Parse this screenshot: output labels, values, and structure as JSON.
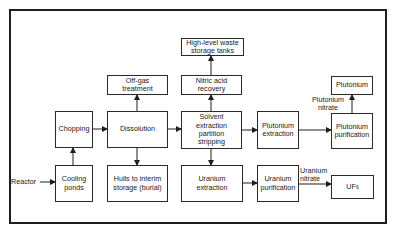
{
  "diagram": {
    "nodes": {
      "reactor": {
        "label": "Reactor"
      },
      "cooling_ponds": {
        "label": "Cooling\nponds"
      },
      "chopping": {
        "label": "Chopping"
      },
      "dissolution": {
        "label": "Dissolution"
      },
      "off_gas": {
        "label": "Off-gas\ntreatment"
      },
      "hulls": {
        "label": "Hulls to interim\nstorage (burial)"
      },
      "solvent": {
        "label": "Solvent\nextraction\npartition\nstripping"
      },
      "nitric_acid": {
        "label": "Nitric acid\nrecovery"
      },
      "hlw_tanks": {
        "label": "High-level waste\nstorage tanks"
      },
      "pu_extraction": {
        "label": "Plutonium\nextraction"
      },
      "pu_purification": {
        "label": "Plutonium\npurification"
      },
      "plutonium": {
        "label": "Plutonium"
      },
      "u_extraction": {
        "label": "Uranium\nextraction"
      },
      "u_purification": {
        "label": "Uranium\npurification"
      },
      "uf6": {
        "label": "UF",
        "subscript": "6"
      }
    },
    "edge_labels": {
      "plutonium_nitrate": "Plutonium\nnitrate",
      "uranium_nitrate": "Uranium\nnitrate"
    },
    "edges": [
      [
        "reactor",
        "cooling_ponds"
      ],
      [
        "cooling_ponds",
        "chopping"
      ],
      [
        "chopping",
        "dissolution"
      ],
      [
        "dissolution",
        "off_gas"
      ],
      [
        "dissolution",
        "hulls"
      ],
      [
        "dissolution",
        "solvent"
      ],
      [
        "solvent",
        "nitric_acid"
      ],
      [
        "nitric_acid",
        "hlw_tanks"
      ],
      [
        "solvent",
        "pu_extraction"
      ],
      [
        "solvent",
        "u_extraction"
      ],
      [
        "pu_extraction",
        "pu_purification"
      ],
      [
        "pu_purification",
        "plutonium"
      ],
      [
        "u_extraction",
        "u_purification"
      ],
      [
        "u_purification",
        "uf6"
      ]
    ],
    "colors": {
      "line": "#1e1e1e",
      "background": "#ffffff"
    }
  }
}
